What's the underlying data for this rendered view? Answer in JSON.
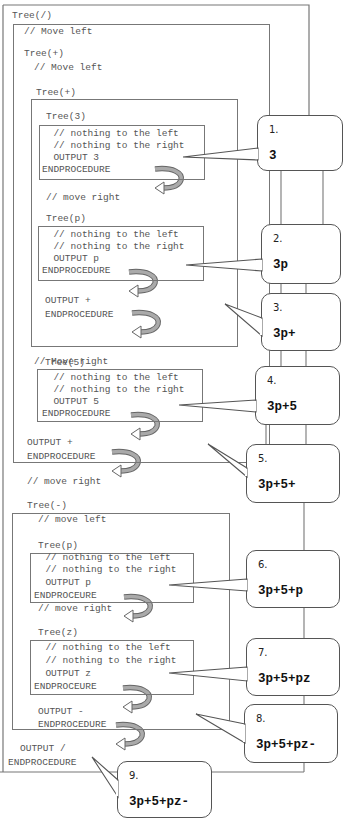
{
  "frames": {
    "tree_div": {
      "label": "Tree(/)",
      "comment": "// Move left",
      "output": "OUTPUT /",
      "end": "ENDPROCEDURE"
    },
    "tree_plus_outer": {
      "label": "Tree(+)",
      "comment": "// Move left",
      "output": "OUTPUT +",
      "end": "ENDPROCEDURE",
      "after": "// move right"
    },
    "tree_plus_inner": {
      "label": "Tree(+)",
      "between": "// move right",
      "output": "OUTPUT +",
      "end": "ENDPROCEDURE",
      "after": "// Move right"
    },
    "tree_3": {
      "label": "Tree(3)",
      "lines": [
        "  // nothing to the left",
        "  // nothing to the right",
        "  OUTPUT 3",
        "ENDPROCEDURE"
      ]
    },
    "tree_p1": {
      "label": "Tree(p)",
      "lines": [
        "  // nothing to the left",
        "  // nothing to the right",
        "  OUTPUT p",
        "ENDPROCEDURE"
      ]
    },
    "tree_5": {
      "label": "Tree(5)",
      "lines": [
        "  // nothing to the left",
        "  // nothing to the right",
        "  OUTPUT 5",
        "ENDPROCEDURE"
      ]
    },
    "tree_minus": {
      "label": "Tree(-)",
      "comment": "// move left",
      "between": "// move right",
      "output": "OUTPUT -",
      "end": "ENDPROCEDURE"
    },
    "tree_p2": {
      "label": "Tree(p)",
      "lines": [
        "  // nothing to the left",
        "  // nothing to the right",
        "  OUTPUT p",
        "ENDPROCEURE"
      ]
    },
    "tree_z": {
      "label": "Tree(z)",
      "lines": [
        "  // nothing to the left",
        "  // nothing to the right",
        "  OUTPUT z",
        "ENDPROCEURE"
      ]
    }
  },
  "callouts": [
    {
      "num": "1.",
      "result": "3"
    },
    {
      "num": "2.",
      "result": "3p"
    },
    {
      "num": "3.",
      "result": "3p+"
    },
    {
      "num": "4.",
      "result": "3p+5"
    },
    {
      "num": "5.",
      "result": "3p+5+"
    },
    {
      "num": "6.",
      "result": "3p+5+p"
    },
    {
      "num": "7.",
      "result": "3p+5+pz"
    },
    {
      "num": "8.",
      "result": "3p+5+pz-"
    },
    {
      "num": "9.",
      "result": "3p+5+pz-"
    }
  ],
  "colors": {
    "line": "#777777",
    "arrow_fill": "#999999",
    "text": "#555555"
  }
}
